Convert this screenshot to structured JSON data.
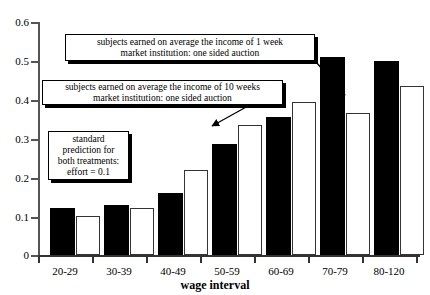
{
  "chart_data": {
    "type": "bar",
    "title": "",
    "xlabel": "wage interval",
    "ylabel": "",
    "ylim": [
      0,
      0.6
    ],
    "yticks": [
      "0",
      "0.1",
      "0.2",
      "0.3",
      "0.4",
      "0.5",
      "0.6"
    ],
    "ytick_values": [
      0,
      0.1,
      0.2,
      0.3,
      0.4,
      0.5,
      0.6
    ],
    "grid": false,
    "legend": "none",
    "categories": [
      "20-29",
      "30-39",
      "40-49",
      "50-59",
      "60-69",
      "70-79",
      "80-120"
    ],
    "series": [
      {
        "name": "income of 1 week",
        "fill": "black",
        "values": [
          0.12,
          0.13,
          0.16,
          0.285,
          0.355,
          0.51,
          0.5
        ]
      },
      {
        "name": "income of 10 weeks",
        "fill": "white",
        "values": [
          0.1,
          0.12,
          0.22,
          0.335,
          0.395,
          0.365,
          0.435
        ]
      }
    ],
    "annotations": [
      {
        "id": "callout-1-week",
        "line1": "subjects earned on average the income of 1 week",
        "line2": "market institution: one sided auction"
      },
      {
        "id": "callout-10-weeks",
        "line1": "subjects earned on average the income of 10 weeks",
        "line2": "market institution: one sided auction"
      },
      {
        "id": "callout-standard-prediction",
        "line1": "standard",
        "line2": "prediction for",
        "line3": "both treatments:",
        "line4": "effort = 0.1"
      }
    ]
  },
  "colors": {
    "series_dark": "#000000",
    "series_light": "#ffffff",
    "axis": "#333333",
    "background": "#ffffff"
  }
}
